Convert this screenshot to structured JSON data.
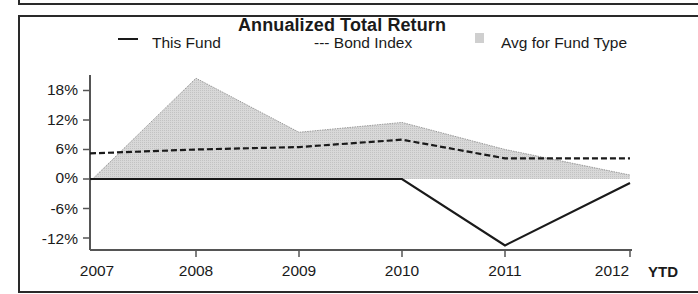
{
  "chart_data": {
    "type": "line",
    "title": "Annualized Total Return",
    "xlabel": "",
    "ylabel": "",
    "categories": [
      "2007",
      "2008",
      "2009",
      "2010",
      "2011",
      "2012"
    ],
    "x_suffix_label": "YTD",
    "yticks": [
      "18%",
      "12%",
      "6%",
      "0%",
      "-6%",
      "-12%"
    ],
    "ylim": [
      -14,
      21
    ],
    "grid": false,
    "legend_position": "top",
    "series": [
      {
        "name": "This Fund",
        "style": "solid-line",
        "values": [
          0,
          0,
          0,
          0,
          -13.5,
          -0.8
        ]
      },
      {
        "name": "Bond Index",
        "style": "dashed-line",
        "values": [
          5.2,
          6.0,
          6.5,
          8.0,
          4.2,
          4.2
        ]
      },
      {
        "name": "Avg for Fund Type",
        "style": "shaded-area",
        "values": [
          -0.5,
          20.5,
          9.5,
          11.5,
          6.0,
          0.8
        ]
      }
    ]
  },
  "legend": {
    "this_fund": "This Fund",
    "bond_index": "--- Bond Index",
    "avg_type": "Avg for Fund Type"
  },
  "colors": {
    "area_fill": "#d4d4d4",
    "area_edge": "#9a9a9a",
    "line": "#1a1a1a",
    "axis": "#555555"
  }
}
